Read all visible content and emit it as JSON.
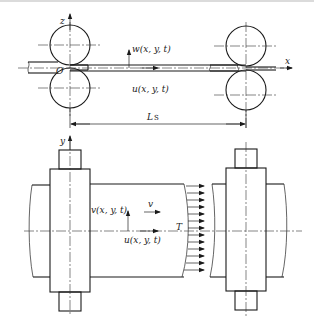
{
  "figure": {
    "type": "technical-diagram",
    "colors": {
      "line": "#1a1a1a",
      "background": "#ffffff",
      "top_rule": "#cfcfcf"
    }
  },
  "side_view": {
    "axis_z_label": "z",
    "axis_x_label": "x",
    "origin_label": "O",
    "transverse_displacement_label": "w(x, y, t)",
    "longitudinal_displacement_label": "u(x, y, t)",
    "span_label_main": "L",
    "span_label_sub": "S"
  },
  "plan_view": {
    "axis_y_label": "y",
    "lateral_displacement_label": "v(x, y, t)",
    "velocity_label": "v",
    "tension_label": "T",
    "longitudinal_displacement_label": "u(x, y, t)",
    "tension_arrow_count": 13
  }
}
